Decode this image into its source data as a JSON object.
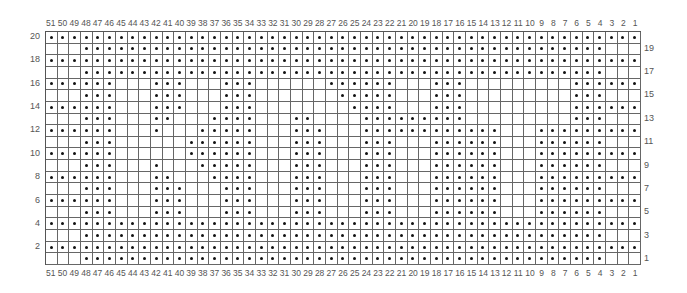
{
  "chart_title": "",
  "columns": 51,
  "rows": 20,
  "column_labels_top": [
    "51",
    "50",
    "49",
    "48",
    "47",
    "46",
    "45",
    "44",
    "43",
    "42",
    "41",
    "40",
    "39",
    "38",
    "37",
    "36",
    "35",
    "34",
    "33",
    "32",
    "31",
    "30",
    "29",
    "28",
    "27",
    "26",
    "25",
    "24",
    "23",
    "22",
    "21",
    "20",
    "19",
    "18",
    "17",
    "16",
    "15",
    "14",
    "13",
    "12",
    "11",
    "10",
    "9",
    "8",
    "7",
    "6",
    "5",
    "4",
    "3",
    "2",
    "1"
  ],
  "column_labels_bottom": [
    "51",
    "50",
    "49",
    "48",
    "47",
    "46",
    "45",
    "44",
    "43",
    "42",
    "41",
    "40",
    "39",
    "38",
    "37",
    "36",
    "35",
    "34",
    "33",
    "32",
    "31",
    "30",
    "29",
    "28",
    "27",
    "26",
    "25",
    "24",
    "23",
    "22",
    "21",
    "20",
    "19",
    "18",
    "17",
    "16",
    "15",
    "14",
    "13",
    "12",
    "11",
    "10",
    "9",
    "8",
    "7",
    "6",
    "5",
    "4",
    "3",
    "2",
    "1"
  ],
  "row_labels_left": [
    "20",
    "18",
    "16",
    "14",
    "12",
    "10",
    "8",
    "6",
    "4",
    "2"
  ],
  "row_labels_right": [
    "19",
    "17",
    "15",
    "13",
    "11",
    "9",
    "7",
    "5",
    "3",
    "1"
  ],
  "legend_symbol": "dot",
  "pattern_rows": {
    "20": [
      [
        51,
        1
      ]
    ],
    "19": [
      [
        48,
        4
      ]
    ],
    "18": [
      [
        51,
        1
      ]
    ],
    "17": [
      [
        48,
        4
      ]
    ],
    "16": [
      [
        51,
        46
      ],
      [
        42,
        40
      ],
      [
        36,
        34
      ],
      [
        27,
        22
      ],
      [
        18,
        16
      ],
      [
        6,
        1
      ]
    ],
    "15": [
      [
        48,
        46
      ],
      [
        42,
        40
      ],
      [
        36,
        34
      ],
      [
        26,
        22
      ],
      [
        18,
        16
      ],
      [
        6,
        4
      ]
    ],
    "14": [
      [
        51,
        46
      ],
      [
        42,
        40
      ],
      [
        36,
        34
      ],
      [
        25,
        22
      ],
      [
        18,
        16
      ],
      [
        6,
        1
      ]
    ],
    "13": [
      [
        48,
        46
      ],
      [
        42,
        41
      ],
      [
        37,
        34
      ],
      [
        30,
        29
      ],
      [
        24,
        16
      ],
      [
        6,
        4
      ]
    ],
    "12": [
      [
        51,
        46
      ],
      [
        42,
        42
      ],
      [
        38,
        34
      ],
      [
        30,
        28
      ],
      [
        24,
        13
      ],
      [
        9,
        1
      ]
    ],
    "11": [
      [
        48,
        46
      ],
      [
        39,
        34
      ],
      [
        30,
        28
      ],
      [
        24,
        22
      ],
      [
        18,
        13
      ],
      [
        9,
        4
      ]
    ],
    "10": [
      [
        51,
        46
      ],
      [
        39,
        34
      ],
      [
        30,
        28
      ],
      [
        24,
        22
      ],
      [
        18,
        13
      ],
      [
        9,
        1
      ]
    ],
    "9": [
      [
        48,
        46
      ],
      [
        42,
        42
      ],
      [
        38,
        34
      ],
      [
        30,
        28
      ],
      [
        24,
        22
      ],
      [
        18,
        13
      ],
      [
        9,
        4
      ]
    ],
    "8": [
      [
        51,
        46
      ],
      [
        42,
        41
      ],
      [
        37,
        34
      ],
      [
        30,
        28
      ],
      [
        24,
        22
      ],
      [
        18,
        13
      ],
      [
        9,
        1
      ]
    ],
    "7": [
      [
        48,
        46
      ],
      [
        42,
        40
      ],
      [
        36,
        34
      ],
      [
        30,
        28
      ],
      [
        24,
        22
      ],
      [
        18,
        13
      ],
      [
        9,
        4
      ]
    ],
    "6": [
      [
        51,
        46
      ],
      [
        42,
        40
      ],
      [
        36,
        34
      ],
      [
        30,
        28
      ],
      [
        24,
        22
      ],
      [
        18,
        13
      ],
      [
        9,
        1
      ]
    ],
    "5": [
      [
        48,
        46
      ],
      [
        42,
        40
      ],
      [
        36,
        34
      ],
      [
        30,
        28
      ],
      [
        24,
        22
      ],
      [
        18,
        13
      ],
      [
        9,
        4
      ]
    ],
    "4": [
      [
        51,
        1
      ]
    ],
    "3": [
      [
        48,
        4
      ]
    ],
    "2": [
      [
        51,
        1
      ]
    ],
    "1": [
      [
        48,
        4
      ]
    ]
  },
  "colors": {
    "grid_line": "#666666",
    "dot": "#111111",
    "label": "#555555",
    "background": "#ffffff"
  }
}
